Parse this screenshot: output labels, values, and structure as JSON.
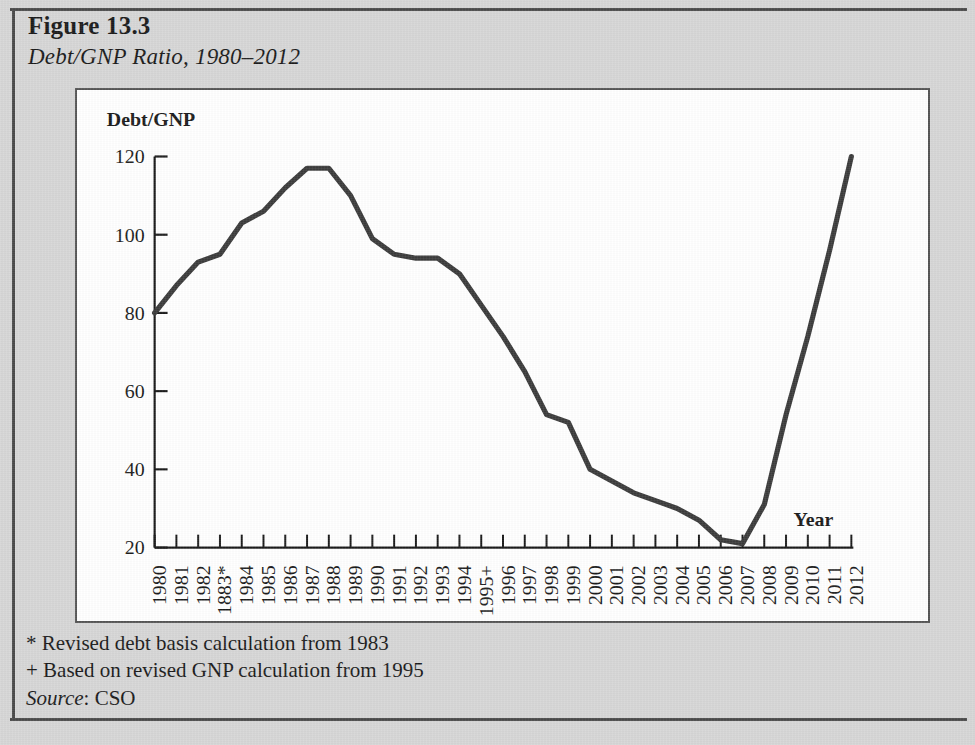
{
  "figure": {
    "title": "Figure 13.3",
    "subtitle": "Debt/GNP Ratio, 1980–2012"
  },
  "footnotes": {
    "asterisk": "* Revised debt basis calculation from 1983",
    "plus": "+ Based on revised GNP calculation from 1995",
    "source_label": "Source",
    "source_value": ": CSO"
  },
  "colors": {
    "page_background": "#d6d6d6",
    "panel_background": "#ffffff",
    "panel_border": "#555555",
    "line": "#3b3b3b",
    "axis": "#1a1a1a",
    "text": "#1a1a1a"
  },
  "chart_data": {
    "type": "line",
    "title": "Debt/GNP Ratio, 1980–2012",
    "xlabel": "Year",
    "ylabel": "Debt/GNP",
    "ylim": [
      20,
      120
    ],
    "ytick_values": [
      20,
      40,
      60,
      80,
      100,
      120
    ],
    "ytick_labels": [
      "20",
      "40",
      "60",
      "80",
      "100",
      "120"
    ],
    "grid": false,
    "legend": false,
    "x": [
      1980,
      1981,
      1982,
      1983,
      1984,
      1985,
      1986,
      1987,
      1988,
      1989,
      1990,
      1991,
      1992,
      1993,
      1994,
      1995,
      1996,
      1997,
      1998,
      1999,
      2000,
      2001,
      2002,
      2003,
      2004,
      2005,
      2006,
      2007,
      2008,
      2009,
      2010,
      2011,
      2012
    ],
    "xtick_labels": [
      "1980",
      "1981",
      "1982",
      "1883*",
      "1984",
      "1985",
      "1986",
      "1987",
      "1988",
      "1989",
      "1990",
      "1991",
      "1992",
      "1993",
      "1994",
      "1995+",
      "1996",
      "1997",
      "1998",
      "1999",
      "2000",
      "2001",
      "2002",
      "2003",
      "2004",
      "2005",
      "2006",
      "2007",
      "2008",
      "2009",
      "2010",
      "2011",
      "2012"
    ],
    "values": [
      80,
      87,
      93,
      95,
      103,
      106,
      112,
      117,
      117,
      110,
      99,
      95,
      94,
      94,
      90,
      82,
      74,
      65,
      54,
      52,
      40,
      37,
      34,
      32,
      30,
      27,
      22,
      21,
      31,
      54,
      74,
      96,
      120
    ],
    "series": [
      {
        "name": "Debt/GNP",
        "values": [
          80,
          87,
          93,
          95,
          103,
          106,
          112,
          117,
          117,
          110,
          99,
          95,
          94,
          94,
          90,
          82,
          74,
          65,
          54,
          52,
          40,
          37,
          34,
          32,
          30,
          27,
          22,
          21,
          31,
          54,
          74,
          96,
          120
        ]
      }
    ],
    "annotations": [
      {
        "name": "year-axis-label",
        "text": "Year"
      },
      {
        "name": "value-axis-label",
        "text": "Debt/GNP"
      }
    ]
  }
}
